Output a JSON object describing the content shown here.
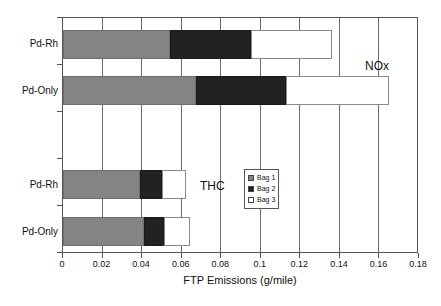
{
  "chart_data": {
    "type": "bar",
    "orientation": "horizontal",
    "stacked": true,
    "title": "",
    "xlabel": "FTP Emissions (g/mile)",
    "ylabel": "",
    "xlim": [
      0,
      0.18
    ],
    "xticks": [
      "0",
      "0.02",
      "0.04",
      "0.06",
      "0.08",
      "0.1",
      "0.12",
      "0.14",
      "0.16",
      "0.18"
    ],
    "xtick_values": [
      0,
      0.02,
      0.04,
      0.06,
      0.08,
      0.1,
      0.12,
      0.14,
      0.16,
      0.18
    ],
    "grid": "vertical",
    "legend_position": "center",
    "legend": [
      "Bag 1",
      "Bag 2",
      "Bag 3"
    ],
    "annotations": [
      {
        "text": "NOx",
        "x": 0.167,
        "y": "upper-group"
      },
      {
        "text": "THC",
        "x": 0.082,
        "y": "lower-group"
      }
    ],
    "categories": [
      "Pd-Rh",
      "Pd-Only",
      "Pd-Rh",
      "Pd-Only"
    ],
    "groups": [
      {
        "name": "NOx",
        "bars": [
          {
            "category": "Pd-Rh",
            "Bag 1": 0.054,
            "Bag 2": 0.041,
            "Bag 3": 0.041,
            "total": 0.136
          },
          {
            "category": "Pd-Only",
            "Bag 1": 0.067,
            "Bag 2": 0.046,
            "Bag 3": 0.052,
            "total": 0.165
          }
        ]
      },
      {
        "name": "THC",
        "bars": [
          {
            "category": "Pd-Rh",
            "Bag 1": 0.039,
            "Bag 2": 0.011,
            "Bag 3": 0.012,
            "total": 0.062
          },
          {
            "category": "Pd-Only",
            "Bag 1": 0.041,
            "Bag 2": 0.01,
            "Bag 3": 0.013,
            "total": 0.064
          }
        ]
      }
    ],
    "series": [
      {
        "name": "Bag 1",
        "color": "#848484",
        "values": [
          0.054,
          0.067,
          0.039,
          0.041
        ]
      },
      {
        "name": "Bag 2",
        "color": "#222222",
        "values": [
          0.041,
          0.046,
          0.011,
          0.01
        ]
      },
      {
        "name": "Bag 3",
        "color": "#ffffff",
        "values": [
          0.041,
          0.052,
          0.012,
          0.013
        ]
      }
    ]
  },
  "axis": {
    "x_title": "FTP Emissions (g/mile)",
    "ticks": [
      "0",
      "0.02",
      "0.04",
      "0.06",
      "0.08",
      "0.1",
      "0.12",
      "0.14",
      "0.16",
      "0.18"
    ]
  },
  "bars": [
    {
      "label": "Pd-Rh",
      "s1": 0.054,
      "s2": 0.041,
      "s3": 0.041
    },
    {
      "label": "Pd-Only",
      "s1": 0.067,
      "s2": 0.046,
      "s3": 0.052
    },
    {
      "label": "Pd-Rh",
      "s1": 0.039,
      "s2": 0.011,
      "s3": 0.012
    },
    {
      "label": "Pd-Only",
      "s1": 0.041,
      "s2": 0.01,
      "s3": 0.013
    }
  ],
  "labels": {
    "cat0": "Pd-Rh",
    "cat1": "Pd-Only",
    "cat2": "Pd-Rh",
    "cat3": "Pd-Only"
  },
  "annotations": {
    "nox": "NOx",
    "thc": "THC"
  },
  "legend": {
    "items": [
      {
        "label": "Bag 1",
        "color": "#848484"
      },
      {
        "label": "Bag 2",
        "color": "#222222"
      },
      {
        "label": "Bag 3",
        "color": "#ffffff"
      }
    ]
  }
}
